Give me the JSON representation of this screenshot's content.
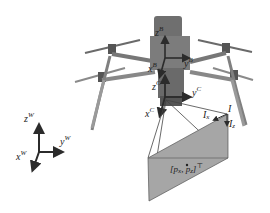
{
  "diagram": {
    "colors": {
      "background": "#ffffff",
      "drone": "#7a7a7a",
      "drone_dark": "#4a4a4a",
      "axis": "#2b2b2b",
      "image_plane": "#a6a6a6",
      "frustum_line": "#444444"
    },
    "frames": {
      "body": {
        "x": {
          "base": "x",
          "sup": "B"
        },
        "y": {
          "base": "y",
          "sup": "B"
        },
        "z": {
          "base": "z",
          "sup": "B"
        }
      },
      "camera": {
        "x": {
          "base": "x",
          "sup": "C"
        },
        "y": {
          "base": "y",
          "sup": "C"
        },
        "z": {
          "base": "z",
          "sup": "C"
        }
      },
      "world": {
        "x": {
          "base": "x",
          "sup": "W"
        },
        "y": {
          "base": "y",
          "sup": "W"
        },
        "z": {
          "base": "z",
          "sup": "W"
        }
      }
    },
    "image_plane": {
      "label": "I",
      "axis_x": {
        "base": "I",
        "sub": "x"
      },
      "axis_z": {
        "base": "I",
        "sub": "z"
      },
      "point": {
        "open": "[",
        "p1": "p",
        "s1": "x",
        "sep": ", ",
        "p2": "p",
        "s2": "z",
        "close": "]",
        "sup": "⊤"
      }
    }
  }
}
